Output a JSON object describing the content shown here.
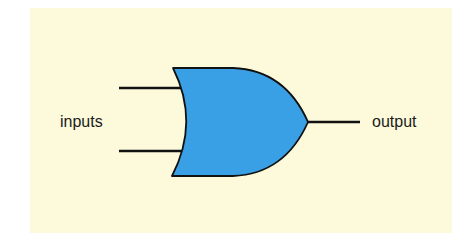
{
  "diagram": {
    "type": "logic-gate",
    "gate": "OR",
    "labels": {
      "inputs": "inputs",
      "output": "output"
    },
    "colors": {
      "background": "#fcfadb",
      "gate_fill": "#3aa0e6",
      "stroke": "#111111"
    }
  }
}
